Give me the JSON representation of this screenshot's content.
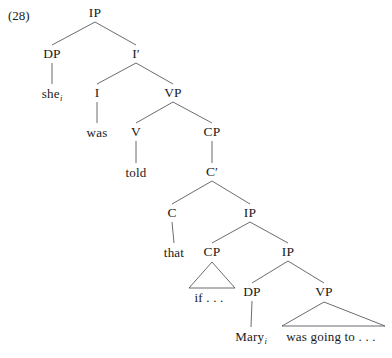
{
  "figure": {
    "example_number": "(28)",
    "type": "syntax-tree",
    "line_color": "#5a5a62",
    "text_color": "#1a1a1a",
    "background": "#ffffff"
  },
  "nodes": [
    {
      "id": "ip-root",
      "label": "IP",
      "x": 95,
      "y": 13,
      "kind": "nonterminal"
    },
    {
      "id": "dp-1",
      "label": "DP",
      "x": 52,
      "y": 54,
      "kind": "nonterminal"
    },
    {
      "id": "ibar",
      "label": "I′",
      "x": 136,
      "y": 54,
      "kind": "nonterminal"
    },
    {
      "id": "she",
      "label": "she",
      "sub": "i",
      "x": 52,
      "y": 93,
      "kind": "terminal"
    },
    {
      "id": "i-head",
      "label": "I",
      "x": 97,
      "y": 93,
      "kind": "nonterminal"
    },
    {
      "id": "vp-1",
      "label": "VP",
      "x": 173,
      "y": 93,
      "kind": "nonterminal"
    },
    {
      "id": "was",
      "label": "was",
      "x": 97,
      "y": 132,
      "kind": "terminal"
    },
    {
      "id": "v-head",
      "label": "V",
      "x": 136,
      "y": 132,
      "kind": "nonterminal"
    },
    {
      "id": "cp-1",
      "label": "CP",
      "x": 212,
      "y": 132,
      "kind": "nonterminal"
    },
    {
      "id": "told",
      "label": "told",
      "x": 136,
      "y": 172,
      "kind": "terminal"
    },
    {
      "id": "cbar",
      "label": "C′",
      "x": 212,
      "y": 172,
      "kind": "nonterminal"
    },
    {
      "id": "c-head",
      "label": "C",
      "x": 172,
      "y": 213,
      "kind": "nonterminal"
    },
    {
      "id": "ip-2",
      "label": "IP",
      "x": 250,
      "y": 213,
      "kind": "nonterminal"
    },
    {
      "id": "that",
      "label": "that",
      "x": 174,
      "y": 252,
      "kind": "terminal"
    },
    {
      "id": "cp-2",
      "label": "CP",
      "x": 212,
      "y": 252,
      "kind": "nonterminal"
    },
    {
      "id": "ip-3",
      "label": "IP",
      "x": 288,
      "y": 252,
      "kind": "nonterminal"
    },
    {
      "id": "if-ellipsis",
      "label": "if . . .",
      "x": 209,
      "y": 297,
      "kind": "terminal"
    },
    {
      "id": "dp-2",
      "label": "DP",
      "x": 252,
      "y": 292,
      "kind": "nonterminal"
    },
    {
      "id": "vp-2",
      "label": "VP",
      "x": 324,
      "y": 292,
      "kind": "nonterminal"
    },
    {
      "id": "mary",
      "label": "Mary",
      "sub": "i",
      "x": 251,
      "y": 336,
      "kind": "terminal"
    },
    {
      "id": "going-ellipsis",
      "label": "was going to . . .",
      "x": 331,
      "y": 336,
      "kind": "terminal"
    }
  ],
  "edges": [
    {
      "from": "ip-root",
      "to": "dp-1"
    },
    {
      "from": "ip-root",
      "to": "ibar"
    },
    {
      "from": "dp-1",
      "to": "she"
    },
    {
      "from": "ibar",
      "to": "i-head"
    },
    {
      "from": "ibar",
      "to": "vp-1"
    },
    {
      "from": "i-head",
      "to": "was"
    },
    {
      "from": "vp-1",
      "to": "v-head"
    },
    {
      "from": "vp-1",
      "to": "cp-1"
    },
    {
      "from": "v-head",
      "to": "told"
    },
    {
      "from": "cp-1",
      "to": "cbar"
    },
    {
      "from": "cbar",
      "to": "c-head"
    },
    {
      "from": "cbar",
      "to": "ip-2"
    },
    {
      "from": "c-head",
      "to": "that"
    },
    {
      "from": "ip-2",
      "to": "cp-2"
    },
    {
      "from": "ip-2",
      "to": "ip-3"
    },
    {
      "from": "ip-3",
      "to": "dp-2"
    },
    {
      "from": "ip-3",
      "to": "vp-2"
    },
    {
      "from": "dp-2",
      "to": "mary"
    }
  ],
  "triangles": [
    {
      "id": "triangle-cp-2",
      "parent": "cp-2",
      "apex_x": 212,
      "apex_y": 262,
      "left_x": 189,
      "right_x": 235,
      "base_y": 288
    },
    {
      "id": "triangle-vp-2",
      "parent": "vp-2",
      "apex_x": 324,
      "apex_y": 302,
      "left_x": 282,
      "right_x": 385,
      "base_y": 326
    }
  ]
}
